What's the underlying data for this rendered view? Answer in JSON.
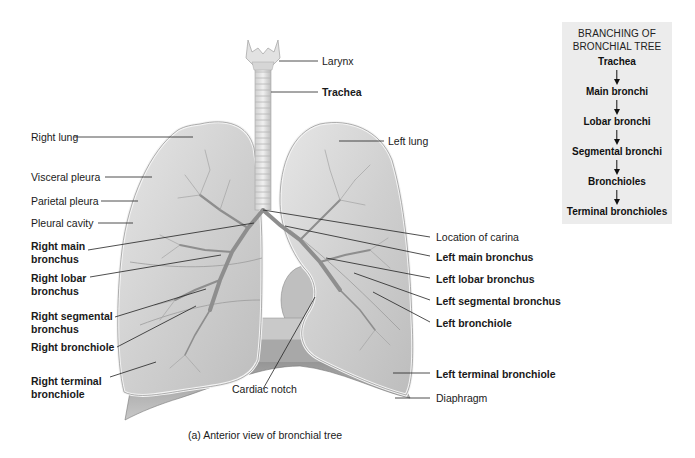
{
  "figure": {
    "caption": "(a) Anterior view of bronchial tree"
  },
  "labels_left": [
    {
      "id": "right-lung",
      "text": "Right lung",
      "bold": false
    },
    {
      "id": "visceral-pleura",
      "text": "Visceral pleura",
      "bold": false
    },
    {
      "id": "parietal-pleura",
      "text": "Parietal pleura",
      "bold": false
    },
    {
      "id": "pleural-cavity",
      "text": "Pleural cavity",
      "bold": false
    },
    {
      "id": "right-main-bronchus",
      "text": "Right main\nbronchus",
      "line1": "Right main",
      "line2": "bronchus",
      "bold": true
    },
    {
      "id": "right-lobar-bronchus",
      "text": "Right lobar\nbronchus",
      "line1": "Right lobar",
      "line2": "bronchus",
      "bold": true
    },
    {
      "id": "right-segmental-bronchus",
      "text": "Right segmental\nbronchus",
      "line1": "Right segmental",
      "line2": "bronchus",
      "bold": true
    },
    {
      "id": "right-bronchiole",
      "text": "Right bronchiole",
      "bold": true
    },
    {
      "id": "right-terminal-bronchiole",
      "text": "Right terminal\nbronchiole",
      "line1": "Right terminal",
      "line2": "bronchiole",
      "bold": true
    }
  ],
  "labels_right": [
    {
      "id": "larynx",
      "text": "Larynx",
      "bold": false
    },
    {
      "id": "trachea",
      "text": "Trachea",
      "bold": true
    },
    {
      "id": "left-lung",
      "text": "Left lung",
      "bold": false
    },
    {
      "id": "location-of-carina",
      "text": "Location of carina",
      "bold": false
    },
    {
      "id": "left-main-bronchus",
      "text": "Left main bronchus",
      "bold": true
    },
    {
      "id": "left-lobar-bronchus",
      "text": "Left lobar bronchus",
      "bold": true
    },
    {
      "id": "left-segmental-bronchus",
      "text": "Left segmental bronchus",
      "bold": true
    },
    {
      "id": "left-bronchiole",
      "text": "Left bronchiole",
      "bold": true
    },
    {
      "id": "left-terminal-bronchiole",
      "text": "Left terminal bronchiole",
      "bold": true
    },
    {
      "id": "diaphragm",
      "text": "Diaphragm",
      "bold": false
    }
  ],
  "labels_bottom": [
    {
      "id": "cardiac-notch",
      "text": "Cardiac notch",
      "bold": false
    }
  ],
  "sidebar": {
    "title_line1": "BRANCHING OF",
    "title_line2": "BRONCHIAL TREE",
    "steps": [
      "Trachea",
      "Main bronchi",
      "Lobar bronchi",
      "Segmental bronchi",
      "Bronchioles",
      "Terminal bronchioles"
    ],
    "background": "#ececec"
  },
  "colors": {
    "lung_fill": "#d6d6d6",
    "lung_edge": "#f2f2f2",
    "tissue_dark": "#9a9a9a",
    "leader_line": "#222222"
  }
}
